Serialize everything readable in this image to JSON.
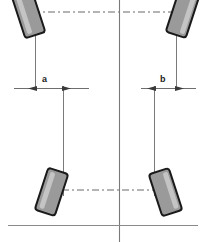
{
  "diagram": {
    "canvas": {
      "width": 205,
      "height": 242
    },
    "colors": {
      "wheel_fill": "#9a9a9a",
      "wheel_stroke": "#1a1a1a",
      "wheel_highlight": "#c9c9c9",
      "line": "#6b6b6b",
      "centerline": "#7a7a7a",
      "dashed": "#6b6b6b",
      "ground": "#8a8a8a",
      "label_text": "#1a1a1a",
      "background": "#ffffff"
    },
    "labels": {
      "dimension_a": "a",
      "dimension_b": "b"
    },
    "elements": {
      "centerline_name": "vehicle-centerline",
      "ground_line_name": "ground-reference-line",
      "front_axle_name": "front-axle-dashed-line",
      "rear_axle_name": "rear-axle-dashed-line"
    },
    "wheels": [
      {
        "id": "front-left",
        "position": "top-left",
        "tilt_deg": -18
      },
      {
        "id": "front-right",
        "position": "top-right",
        "tilt_deg": 18
      },
      {
        "id": "rear-left",
        "position": "bottom-left",
        "tilt_deg": 18
      },
      {
        "id": "rear-right",
        "position": "bottom-right",
        "tilt_deg": -18
      }
    ],
    "dimensions": [
      {
        "id": "a",
        "label": "a",
        "side": "left",
        "label_x": 42,
        "label_y": 80,
        "line_y": 88,
        "x_start": 14,
        "x_end": 89
      },
      {
        "id": "b",
        "label": "b",
        "side": "right",
        "label_x": 164,
        "label_y": 80,
        "line_y": 88,
        "x_start": 141,
        "x_end": 196
      }
    ]
  }
}
